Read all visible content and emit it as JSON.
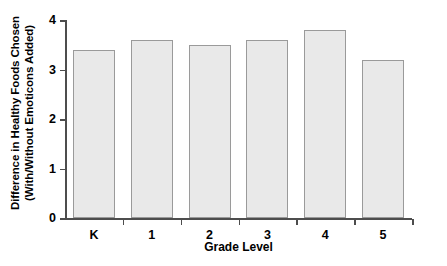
{
  "chart_data": {
    "type": "bar",
    "title": "",
    "subtitle": "",
    "categories": [
      "K",
      "1",
      "2",
      "3",
      "4",
      "5"
    ],
    "values": [
      3.4,
      3.6,
      3.5,
      3.6,
      3.8,
      3.2
    ],
    "xlabel": "Grade Level",
    "ylabel_line1": "Difference in Healthy Foods Chosen",
    "ylabel_line2": "(With/Without Emoticons Added)",
    "ylim": [
      0,
      4
    ],
    "yticks": [
      0,
      1,
      2,
      3,
      4
    ],
    "ytick_labels": [
      "0",
      "1",
      "2",
      "3",
      "4"
    ],
    "grid": false,
    "legend": null,
    "bar_fill_color": "#e9e9e9",
    "bar_edge_color": "#9a9a9a",
    "axis_color": "#4d4d4d",
    "background_color": "#ffffff"
  }
}
